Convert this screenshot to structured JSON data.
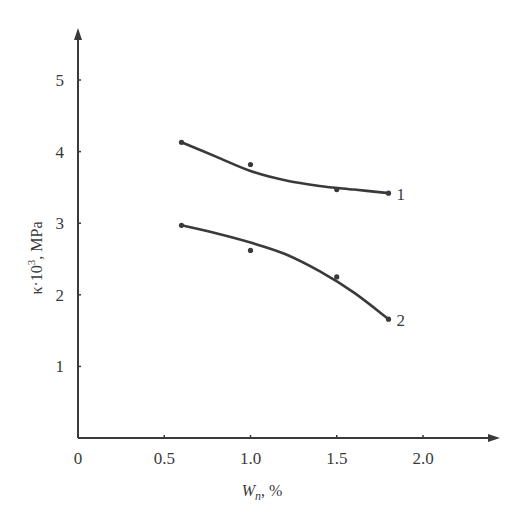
{
  "chart_data": {
    "type": "line",
    "title": "",
    "xlabel": "W_n, %",
    "xlabel_main": "W",
    "xlabel_sub": "n",
    "xlabel_suffix": ", %",
    "ylabel": "κ·10³, MPa",
    "ylabel_main": "κ·10",
    "ylabel_sup": "3",
    "ylabel_suffix": ", MPa",
    "xlim": [
      0,
      2.4
    ],
    "ylim": [
      0,
      5.5
    ],
    "x_ticks": [
      0,
      0.5,
      1.0,
      1.5,
      2.0
    ],
    "x_tick_labels": [
      "0",
      "0.5",
      "1.0",
      "1.5",
      "2.0"
    ],
    "y_ticks": [
      1,
      2,
      3,
      4,
      5
    ],
    "y_tick_labels": [
      "1",
      "2",
      "3",
      "4",
      "5"
    ],
    "grid": false,
    "legend": "inline labels at line ends",
    "series": [
      {
        "name": "1",
        "points": [
          [
            0.6,
            4.13
          ],
          [
            1.0,
            3.82
          ],
          [
            1.5,
            3.47
          ],
          [
            1.8,
            3.42
          ]
        ],
        "fit": [
          [
            0.6,
            4.13
          ],
          [
            0.8,
            3.93
          ],
          [
            1.0,
            3.73
          ],
          [
            1.2,
            3.6
          ],
          [
            1.4,
            3.52
          ],
          [
            1.6,
            3.47
          ],
          [
            1.8,
            3.42
          ]
        ]
      },
      {
        "name": "2",
        "points": [
          [
            0.6,
            2.97
          ],
          [
            1.0,
            2.62
          ],
          [
            1.5,
            2.25
          ],
          [
            1.8,
            1.66
          ]
        ],
        "fit": [
          [
            0.6,
            2.97
          ],
          [
            0.8,
            2.86
          ],
          [
            1.0,
            2.73
          ],
          [
            1.2,
            2.57
          ],
          [
            1.4,
            2.33
          ],
          [
            1.6,
            2.03
          ],
          [
            1.8,
            1.66
          ]
        ]
      }
    ],
    "colors": {
      "ink": "#3a3a3a",
      "background": "#ffffff"
    }
  }
}
